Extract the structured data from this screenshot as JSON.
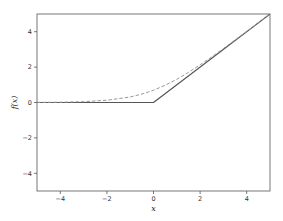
{
  "chart_data": {
    "type": "line",
    "title": "",
    "xlabel": "x",
    "ylabel": "f(x)",
    "xlim": [
      -5,
      5
    ],
    "ylim": [
      -5,
      5
    ],
    "grid": false,
    "legend": null,
    "xticks": [
      -4,
      -2,
      0,
      2,
      4
    ],
    "yticks": [
      -4,
      -2,
      0,
      2,
      4
    ],
    "xtick_labels": [
      "−4",
      "−2",
      "0",
      "2",
      "4"
    ],
    "ytick_labels": [
      "−4",
      "−2",
      "0",
      "2",
      "4"
    ],
    "series": [
      {
        "name": "ReLU max(0, x)",
        "style": "solid",
        "color": "#555555",
        "x": [
          -5,
          0,
          5
        ],
        "y": [
          0,
          0,
          5
        ]
      },
      {
        "name": "Softplus ln(1 + e^x)",
        "style": "dashed",
        "color": "#999999",
        "x": [
          -5,
          -4,
          -3,
          -2,
          -1,
          -0.5,
          0,
          0.5,
          1,
          1.5,
          2,
          2.5,
          3,
          3.5,
          4,
          4.5,
          5
        ],
        "y": [
          0.0067,
          0.018,
          0.049,
          0.127,
          0.313,
          0.474,
          0.693,
          0.974,
          1.313,
          1.701,
          2.127,
          2.579,
          3.049,
          3.53,
          4.018,
          4.511,
          5.007
        ]
      }
    ]
  },
  "plot": {
    "frame": {
      "left": 37,
      "top": 14,
      "right": 270,
      "bottom": 191
    },
    "axes_color": "#555555",
    "ylabel_text": "f(x)",
    "xlabel_text": "x"
  }
}
